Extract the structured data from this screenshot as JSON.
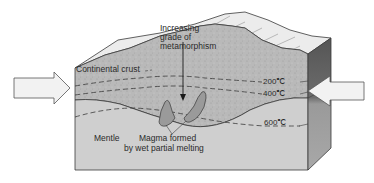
{
  "diagram": {
    "type": "block-diagram",
    "labels": {
      "continental_crust": "Continental crust",
      "metamorphism_line1": "Increasing",
      "metamorphism_line2": "grade of",
      "metamorphism_line3": "metamorphism",
      "mantle": "Mentle",
      "magma_line1": "Magma formed",
      "magma_line2": "by wet partial melting"
    },
    "isotherms": [
      {
        "label": "200℃",
        "value_c": 200
      },
      {
        "label": "400℃",
        "value_c": 400
      },
      {
        "label": "600℃",
        "value_c": 600
      }
    ],
    "arrows": [
      {
        "name": "left-compression-arrow",
        "direction": "right"
      },
      {
        "name": "right-compression-arrow",
        "direction": "left"
      }
    ],
    "colors": {
      "crust": "#b8b8b8",
      "mantle": "#cfcfcf",
      "top_surface": "#ececec",
      "side_face": "#7a7a7a",
      "magma": "#9a9a9a",
      "arrow_fill": "#f2f2f2",
      "line": "#3a3a3a"
    }
  }
}
